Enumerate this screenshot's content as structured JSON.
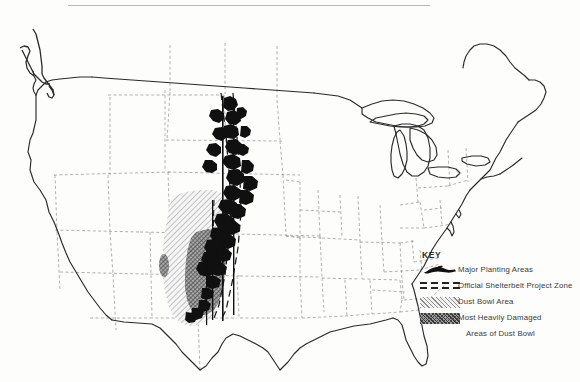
{
  "map": {
    "title": "Dust Bowl and Shelterbelt Project Map of the United States",
    "region": "Contiguous United States",
    "background_color": "#fdfdfc",
    "outline_color": "#2a2a2a",
    "state_border_color": "#8a8a8a"
  },
  "legend": {
    "title": "KEY",
    "entries": [
      {
        "icon": "planting-blob-icon",
        "label": "Major Planting Areas",
        "swatch_type": "solid-blob",
        "color": "#111111"
      },
      {
        "icon": "dashed-band-icon",
        "label": "Official Shelterbelt Project Zone",
        "swatch_type": "dashed-lines",
        "color": "#222222"
      },
      {
        "icon": "diagonal-hatch-icon",
        "label": "Dust Bowl Area",
        "swatch_type": "diagonal-hatch",
        "color": "#8d8d8d"
      },
      {
        "icon": "dense-hatch-icon",
        "label": "Most Heavily Damaged",
        "label_line2": "Areas of Dust Bowl",
        "swatch_type": "dense-cross-hatch",
        "color": "#4a4a4a"
      }
    ]
  },
  "overlays": {
    "shelterbelt_zone": {
      "name": "Official Shelterbelt Project Zone",
      "description": "Narrow north-south band from the Canadian border through the Dakotas, Nebraska, Kansas, Oklahoma into north Texas"
    },
    "dust_bowl_area": {
      "name": "Dust Bowl Area",
      "description": "Hatched region covering eastern Colorado, western Kansas, the Oklahoma and Texas panhandles and eastern New Mexico"
    },
    "most_damaged_area": {
      "name": "Most Heavily Damaged Areas of Dust Bowl",
      "description": "Darker core region centered on the Oklahoma/Texas panhandles and southwestern Kansas"
    },
    "major_planting_areas": {
      "name": "Major Planting Areas",
      "description": "Solid black blobs distributed along the shelterbelt band"
    }
  }
}
